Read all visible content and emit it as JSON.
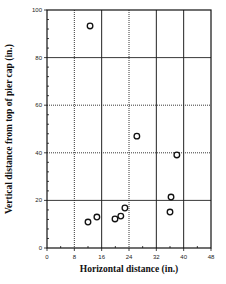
{
  "chart_data": {
    "type": "scatter",
    "title": "",
    "xlabel": "Horizontal distance (in.)",
    "ylabel": "Vertical distance from top of pier cap (in.)",
    "xlim": [
      0,
      48
    ],
    "ylim": [
      0,
      100
    ],
    "xticks": [
      0,
      8,
      16,
      24,
      32,
      40,
      48
    ],
    "yticks": [
      0,
      20,
      40,
      60,
      80,
      100
    ],
    "grid": true,
    "legend": null,
    "marker": "open-circle",
    "series": [
      {
        "name": "measurements",
        "points": [
          {
            "x": 12.6,
            "y": 93.3
          },
          {
            "x": 12.0,
            "y": 10.9
          },
          {
            "x": 14.6,
            "y": 13.0
          },
          {
            "x": 19.9,
            "y": 12.2
          },
          {
            "x": 21.6,
            "y": 13.4
          },
          {
            "x": 22.8,
            "y": 16.8
          },
          {
            "x": 26.3,
            "y": 47.0
          },
          {
            "x": 38.0,
            "y": 39.1
          },
          {
            "x": 36.3,
            "y": 21.4
          },
          {
            "x": 36.0,
            "y": 15.1
          }
        ]
      }
    ]
  },
  "labels": {
    "xlabel": "Horizontal distance (in.)",
    "ylabel": "Vertical distance from top of pier cap (in.)"
  }
}
